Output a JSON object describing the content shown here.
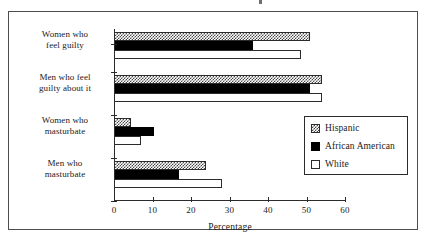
{
  "chart_data": {
    "type": "bar",
    "orientation": "horizontal",
    "title": "",
    "xlabel": "Percentage",
    "ylabel": "",
    "xlim": [
      0,
      60
    ],
    "xticks": [
      0,
      10,
      20,
      30,
      40,
      50,
      60
    ],
    "grid": false,
    "legend_position": "center-right",
    "categories": [
      "Women who feel guilty",
      "Men who feel guilty about it",
      "Women who masturbate",
      "Men who masturbate"
    ],
    "category_lines": [
      [
        "Women who",
        "feel guilty"
      ],
      [
        "Men who feel",
        "guilty about it"
      ],
      [
        "Women who",
        "masturbate"
      ],
      [
        "Men who",
        "masturbate"
      ]
    ],
    "series": [
      {
        "name": "Hispanic",
        "values": [
          51,
          54,
          4.5,
          24
        ]
      },
      {
        "name": "African American",
        "values": [
          36,
          51,
          10.5,
          17
        ]
      },
      {
        "name": "White",
        "values": [
          48.5,
          54,
          7,
          28
        ]
      }
    ]
  },
  "legend": {
    "entries": [
      {
        "label": "Hispanic",
        "swatch": "checkered-swatch-icon"
      },
      {
        "label": "African American",
        "swatch": "solid-black-swatch-icon"
      },
      {
        "label": "White",
        "swatch": "white-swatch-icon"
      }
    ]
  },
  "axis": {
    "x_title": "Percentage",
    "x_tick_labels": [
      "0",
      "10",
      "20",
      "30",
      "40",
      "50",
      "60"
    ]
  }
}
